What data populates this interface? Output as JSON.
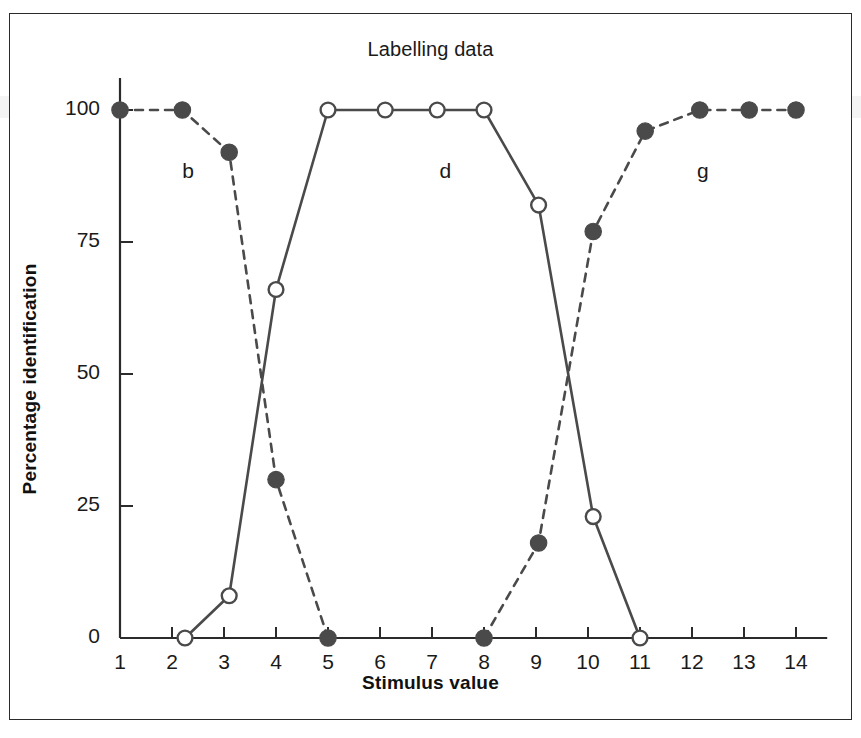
{
  "chart_data": {
    "type": "line",
    "title": "Labelling data",
    "xlabel": "Stimulus value",
    "ylabel": "Percentage identification",
    "xlim": [
      1,
      14.6
    ],
    "ylim": [
      0,
      100
    ],
    "xticks": [
      1,
      2,
      3,
      4,
      5,
      6,
      7,
      8,
      9,
      10,
      11,
      12,
      13,
      14
    ],
    "xtick_labels": [
      "1",
      "2",
      "3",
      "4",
      "5",
      "6",
      "7",
      "8",
      "9",
      "10",
      "11",
      "12",
      "13",
      "14"
    ],
    "yticks": [
      0,
      25,
      50,
      75,
      100
    ],
    "ytick_labels": [
      "0",
      "25",
      "50",
      "75",
      "100"
    ],
    "grid": false,
    "legend": "none",
    "annotations": [
      {
        "text": "b",
        "x": 2.35,
        "y": 88
      },
      {
        "text": "d",
        "x": 7.3,
        "y": 88
      },
      {
        "text": "g",
        "x": 12.25,
        "y": 88
      }
    ],
    "series": [
      {
        "name": "b",
        "marker": "filled-circle",
        "linestyle": "dashed",
        "color": "#4a4a4a",
        "x": [
          1.0,
          2.2,
          3.1,
          4.0,
          5.0
        ],
        "values": [
          100,
          100,
          92,
          30,
          0
        ]
      },
      {
        "name": "d",
        "marker": "open-circle",
        "linestyle": "solid",
        "color": "#4a4a4a",
        "x": [
          2.25,
          3.1,
          4.0,
          5.0,
          6.1,
          7.1,
          8.0,
          9.05,
          10.1,
          11.0
        ],
        "values": [
          0,
          8,
          66,
          100,
          100,
          100,
          100,
          82,
          23,
          0
        ]
      },
      {
        "name": "g",
        "marker": "filled-circle",
        "linestyle": "dashed",
        "color": "#4a4a4a",
        "x": [
          8.0,
          9.05,
          10.1,
          11.1,
          12.15,
          13.1,
          14.0
        ],
        "values": [
          0,
          18,
          77,
          96,
          100,
          100,
          100
        ]
      }
    ]
  },
  "figure": {
    "background_color": "#ffffff",
    "border_color": "#2b2b2b",
    "axis_color": "#2b2b2b",
    "marker_fill_color": "#4a4a4a",
    "marker_open_fill": "#ffffff"
  }
}
